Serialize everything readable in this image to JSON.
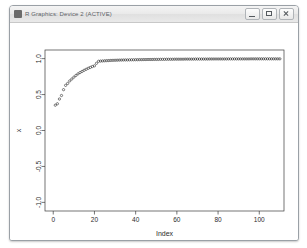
{
  "window": {
    "title": "R Graphics: Device 2 (ACTIVE)",
    "icon": "r-app-icon",
    "controls": [
      {
        "name": "minimize-button",
        "label": "Minimize"
      },
      {
        "name": "maximize-button",
        "label": "Maximize"
      },
      {
        "name": "close-button",
        "label": "Close"
      }
    ]
  },
  "chart_data": {
    "type": "scatter",
    "title": "",
    "xlabel": "Index",
    "ylabel": "x",
    "xlim": [
      -4,
      112
    ],
    "ylim": [
      -1.12,
      1.12
    ],
    "xticks": [
      0,
      20,
      40,
      60,
      80,
      100
    ],
    "xtick_labels": [
      "0",
      "20",
      "40",
      "60",
      "80",
      "100"
    ],
    "yticks": [
      -1.0,
      -0.5,
      0.0,
      0.5,
      1.0
    ],
    "ytick_labels": [
      "-1.0",
      "-0.5",
      "0.0",
      "0.5",
      "1.0"
    ],
    "grid": false,
    "legend": null,
    "point_symbol": "open-circle",
    "point_color": "#1a1a1a",
    "series": [
      {
        "name": "x",
        "x": [
          1,
          2,
          3,
          4,
          5,
          6,
          7,
          8,
          9,
          10,
          11,
          12,
          13,
          14,
          15,
          16,
          17,
          18,
          19,
          20,
          21,
          22,
          23,
          24,
          25,
          26,
          27,
          28,
          29,
          30,
          31,
          32,
          33,
          34,
          35,
          36,
          37,
          38,
          39,
          40,
          41,
          42,
          43,
          44,
          45,
          46,
          47,
          48,
          49,
          50,
          51,
          52,
          53,
          54,
          55,
          56,
          57,
          58,
          59,
          60,
          61,
          62,
          63,
          64,
          65,
          66,
          67,
          68,
          69,
          70,
          71,
          72,
          73,
          74,
          75,
          76,
          77,
          78,
          79,
          80,
          81,
          82,
          83,
          84,
          85,
          86,
          87,
          88,
          89,
          90,
          91,
          92,
          93,
          94,
          95,
          96,
          97,
          98,
          99,
          100,
          101,
          102,
          103,
          104,
          105,
          106,
          107,
          108,
          109,
          110
        ],
        "y": [
          0.352,
          0.372,
          0.438,
          0.487,
          0.568,
          0.628,
          0.655,
          0.69,
          0.716,
          0.742,
          0.766,
          0.788,
          0.806,
          0.822,
          0.838,
          0.852,
          0.866,
          0.878,
          0.89,
          0.9,
          0.935,
          0.963,
          0.966,
          0.968,
          0.97,
          0.972,
          0.973,
          0.975,
          0.976,
          0.977,
          0.978,
          0.979,
          0.98,
          0.981,
          0.982,
          0.982,
          0.983,
          0.984,
          0.984,
          0.985,
          0.985,
          0.986,
          0.986,
          0.987,
          0.987,
          0.988,
          0.988,
          0.988,
          0.989,
          0.989,
          0.989,
          0.99,
          0.99,
          0.99,
          0.991,
          0.991,
          0.991,
          0.991,
          0.992,
          0.992,
          0.992,
          0.992,
          0.992,
          0.993,
          0.993,
          0.993,
          0.993,
          0.993,
          0.994,
          0.994,
          0.994,
          0.994,
          0.994,
          0.994,
          0.994,
          0.995,
          0.995,
          0.995,
          0.995,
          0.995,
          0.995,
          0.995,
          0.995,
          0.995,
          0.996,
          0.996,
          0.996,
          0.996,
          0.996,
          0.996,
          0.996,
          0.996,
          0.996,
          0.996,
          0.996,
          0.997,
          0.997,
          0.997,
          0.997,
          0.997,
          0.997,
          0.997,
          0.997,
          0.997,
          0.997,
          0.997,
          0.997,
          0.997,
          0.997,
          0.997
        ]
      }
    ]
  }
}
